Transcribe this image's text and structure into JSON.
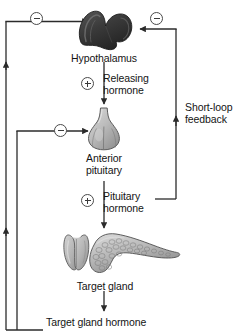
{
  "figure": {
    "background_color": "#ffffff",
    "line_color": "#2b2b2b"
  },
  "nodes": [
    {
      "id": "hypothalamus",
      "label": "Hypothalamus",
      "icon": "hypothalamus-organ-icon",
      "fill": "#3a3a3a",
      "x": 104,
      "y": 31,
      "label_x": 104,
      "label_y": 52
    },
    {
      "id": "anterior-pituitary",
      "label_line1": "Anterior",
      "label_line2": "pituitary",
      "label": "Anterior pituitary",
      "icon": "pituitary-gland-icon",
      "fill": "#b8b8b8",
      "x": 104,
      "y": 133,
      "label_x": 104,
      "label_y": 152
    },
    {
      "id": "target-gland",
      "label": "Target gland",
      "icon": "thyroid-and-pancreas-icon",
      "fill": "#bdbdbd",
      "x": 112,
      "y": 255,
      "label_x": 105,
      "label_y": 280
    }
  ],
  "signals": [
    {
      "id": "releasing-hormone",
      "sign": "+",
      "sign_name": "plus-sign-stimulatory",
      "line1": "Releasing",
      "line2": "hormone",
      "text_x": 103,
      "text_y": 72,
      "sign_x": 81,
      "sign_y": 77
    },
    {
      "id": "pituitary-hormone",
      "sign": "+",
      "sign_name": "plus-sign-stimulatory",
      "line1": "Pituitary",
      "line2": "hormone",
      "text_x": 103,
      "text_y": 190,
      "sign_x": 81,
      "sign_y": 194
    },
    {
      "id": "short-loop-feedback",
      "sign": null,
      "line1": "Short-loop",
      "line2": "feedback",
      "text_x": 185,
      "text_y": 101
    },
    {
      "id": "target-gland-hormone",
      "sign": null,
      "line1": "Target gland hormone",
      "line2": null,
      "text_x": 46,
      "text_y": 316
    }
  ],
  "inhibition_marks": [
    {
      "id": "long-loop-inhibition-hypothalamus",
      "sign": "−",
      "sign_name": "minus-sign-inhibitory",
      "x": 30,
      "y": 12
    },
    {
      "id": "short-loop-inhibition-hypothalamus",
      "sign": "−",
      "sign_name": "minus-sign-inhibitory",
      "x": 150,
      "y": 12
    },
    {
      "id": "long-loop-inhibition-pituitary",
      "sign": "−",
      "sign_name": "minus-sign-inhibitory",
      "x": 54,
      "y": 124
    }
  ],
  "arrows": [
    {
      "id": "hypothalamus-to-pituitary",
      "direction": "down"
    },
    {
      "id": "pituitary-to-target-gland",
      "direction": "down"
    },
    {
      "id": "target-gland-to-hormone",
      "direction": "down"
    },
    {
      "id": "long-loop-to-hypothalamus",
      "direction": "right"
    },
    {
      "id": "long-loop-to-pituitary",
      "direction": "right"
    },
    {
      "id": "short-loop-to-hypothalamus",
      "direction": "left"
    },
    {
      "id": "short-loop-upward",
      "direction": "up"
    },
    {
      "id": "long-loop-upward-upper",
      "direction": "up"
    },
    {
      "id": "long-loop-upward-lower",
      "direction": "up"
    }
  ]
}
